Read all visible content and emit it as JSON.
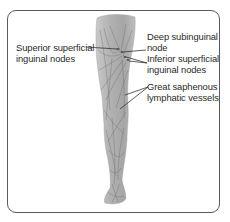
{
  "diagram": {
    "labels": [
      {
        "id": "superior-superficial-inguinal-nodes",
        "lines": [
          "Superior superficial",
          "inguinal nodes"
        ],
        "side": "left"
      },
      {
        "id": "deep-subinguinal-node",
        "lines": [
          "Deep subinguinal",
          "node"
        ],
        "side": "right"
      },
      {
        "id": "inferior-superficial-inguinal-nodes",
        "lines": [
          "Inferior superficial",
          "inguinal nodes"
        ],
        "side": "right"
      },
      {
        "id": "great-saphenous-lymphatic-vessels",
        "lines": [
          "Great saphenous",
          "lymphatic vessels"
        ],
        "side": "right"
      }
    ],
    "colors": {
      "frame_border": "#5a5a5a",
      "leg_fill": "#b4b4b4",
      "leg_shadow": "#8f8f8f",
      "vessel_lines": "#6e6e6e",
      "leader_lines": "#333333",
      "text": "#2a2a2a",
      "background": "#ffffff"
    }
  }
}
